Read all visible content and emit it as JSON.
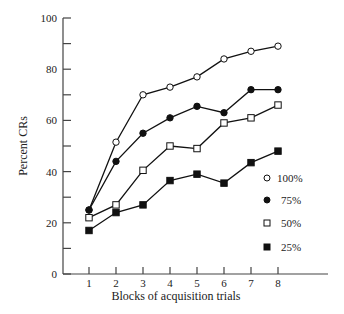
{
  "chart_data": {
    "type": "line",
    "title": "",
    "xlabel": "Blocks of acquisition trials",
    "ylabel": "Percent CRs",
    "x": [
      1,
      2,
      3,
      4,
      5,
      6,
      7,
      8
    ],
    "xticks": [
      "1",
      "2",
      "3",
      "4",
      "5",
      "6",
      "7",
      "8"
    ],
    "yticks": [
      "0",
      "20",
      "40",
      "60",
      "80",
      "100"
    ],
    "ylim": [
      0,
      100
    ],
    "ytick_minor_step": 10,
    "grid": false,
    "legend_position": "right-middle",
    "series": [
      {
        "name": "100%",
        "marker": "open-circle",
        "values": [
          25,
          51.5,
          70,
          73,
          77,
          84,
          87,
          89
        ]
      },
      {
        "name": "75%",
        "marker": "filled-circle",
        "values": [
          25,
          44,
          55,
          61,
          65.5,
          63,
          72,
          72
        ]
      },
      {
        "name": "50%",
        "marker": "open-square",
        "values": [
          22,
          27,
          40.5,
          50,
          49,
          59,
          61,
          66
        ]
      },
      {
        "name": "25%",
        "marker": "filled-square",
        "values": [
          17,
          24,
          27,
          36.5,
          39,
          35.5,
          43.5,
          48
        ]
      }
    ]
  }
}
